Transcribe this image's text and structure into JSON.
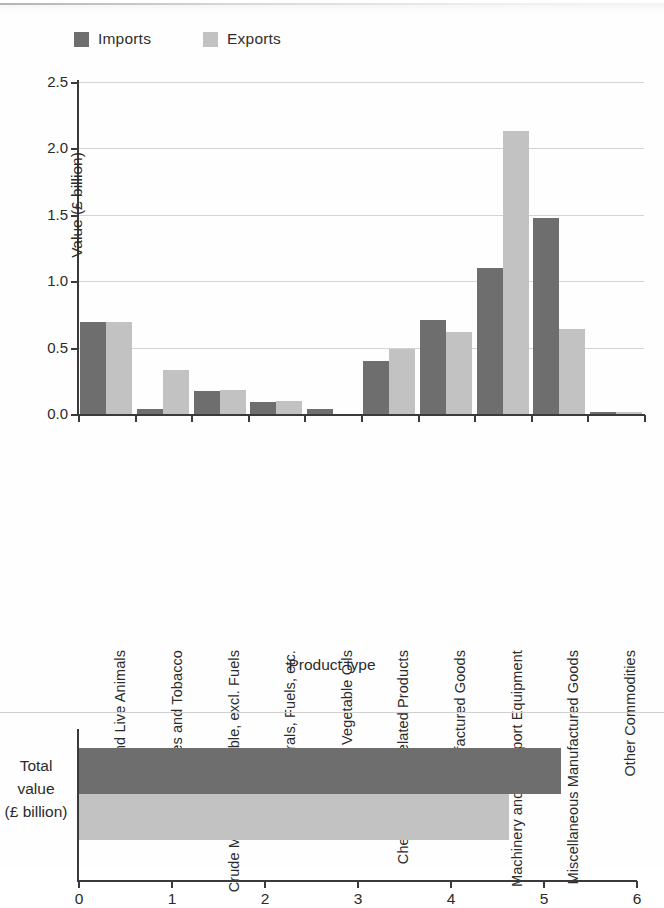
{
  "legend": {
    "items": [
      {
        "label": "Imports",
        "color": "#6e6e6e",
        "icon": "legend-swatch-imports"
      },
      {
        "label": "Exports",
        "color": "#c2c2c2",
        "icon": "legend-swatch-exports"
      }
    ]
  },
  "colors": {
    "imports": "#6e6e6e",
    "exports": "#c2c2c2",
    "axis": "#3a3a3a",
    "grid": "#d4d4d4",
    "text": "#2b2b2b"
  },
  "main": {
    "ylabel": "Value (£ billion)",
    "xlabel": "Product type",
    "yticks": [
      "0.0",
      "0.5",
      "1.0",
      "1.5",
      "2.0",
      "2.5"
    ]
  },
  "total": {
    "label_line1": "Total",
    "label_line2": "value",
    "label_line3": "(£ billion)",
    "xticks": [
      "0",
      "1",
      "2",
      "3",
      "4",
      "5",
      "6"
    ]
  },
  "chart_data": [
    {
      "type": "bar",
      "title": "Imports and Exports by Product Type",
      "orientation": "vertical",
      "xlabel": "Product type",
      "ylabel": "Value (£ billion)",
      "ylim": [
        0.0,
        2.5
      ],
      "ytick_values": [
        0.0,
        0.5,
        1.0,
        1.5,
        2.0,
        2.5
      ],
      "grid": true,
      "legend_position": "top-left",
      "categories": [
        "Food and Live Animals",
        "Beverages and Tobacco",
        "Crude Materials, Inedible, excl. Fuels",
        "Minerals, Fuels, etc.",
        "Animal and Vegetable Oils",
        "Chemicals and Related Products",
        "Manufactured Goods",
        "Machinery and Transport Equipment",
        "Miscellaneous Manufactured Goods",
        "Other Commodities"
      ],
      "series": [
        {
          "name": "Imports",
          "color": "#6e6e6e",
          "values": [
            0.69,
            0.04,
            0.17,
            0.09,
            0.04,
            0.4,
            0.71,
            1.1,
            1.48,
            0.01
          ]
        },
        {
          "name": "Exports",
          "color": "#c2c2c2",
          "values": [
            0.69,
            0.33,
            0.18,
            0.1,
            0.0,
            0.49,
            0.62,
            2.13,
            0.64,
            0.01
          ]
        }
      ]
    },
    {
      "type": "bar",
      "orientation": "horizontal",
      "title": "Total value (£ billion)",
      "xlabel": "",
      "ylabel": "Total value (£ billion)",
      "xlim": [
        0,
        6
      ],
      "xtick_values": [
        0,
        1,
        2,
        3,
        4,
        5,
        6
      ],
      "grid": false,
      "categories": [
        "Total value (£ billion)"
      ],
      "series": [
        {
          "name": "Imports",
          "color": "#6e6e6e",
          "values": [
            5.18
          ]
        },
        {
          "name": "Exports",
          "color": "#c2c2c2",
          "values": [
            4.62
          ]
        }
      ]
    }
  ]
}
